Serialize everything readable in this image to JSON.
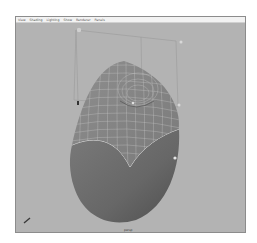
{
  "window": {
    "type": "3d-viewport",
    "menu": [
      {
        "label": "View"
      },
      {
        "label": "Shading"
      },
      {
        "label": "Lighting"
      },
      {
        "label": "Show"
      },
      {
        "label": "Renderer"
      },
      {
        "label": "Panels"
      }
    ],
    "camera_label": "persp"
  },
  "scene": {
    "object": "curved-shell-surface",
    "upper_region": "wireframe-on-shaded",
    "lower_region": "smooth-shaded",
    "bounding_box": "manipulator-cage",
    "colors": {
      "background": "#b3b3b3",
      "shaded_surface": "#6e6e6e",
      "wire_surface": "#8a8a8a",
      "wire_lines": "#c8c8c8",
      "cage": "#9a9a9a"
    }
  }
}
